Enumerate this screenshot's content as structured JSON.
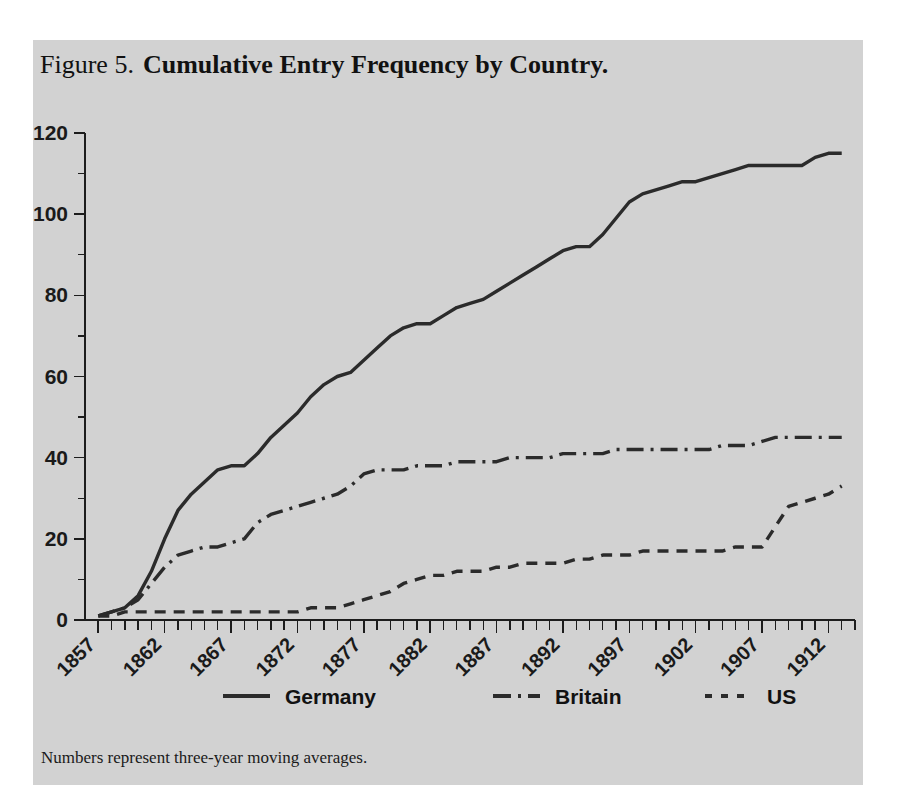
{
  "figure": {
    "number_label": "Figure 5.",
    "title": "Cumulative Entry Frequency by Country.",
    "note": "Numbers represent three-year moving averages.",
    "background_color": "#d2d2d2",
    "page_color": "#ffffff",
    "ink_color": "#2b2b2b"
  },
  "chart_data": {
    "type": "line",
    "title": "Cumulative Entry Frequency by Country.",
    "xlabel": "",
    "ylabel": "",
    "xlim": [
      1856,
      1914
    ],
    "ylim": [
      0,
      120
    ],
    "ytick_values": [
      0,
      20,
      40,
      60,
      80,
      100,
      120
    ],
    "ytick_labels": [
      "0",
      "20",
      "40",
      "60",
      "80",
      "100",
      "120"
    ],
    "y_minor_step": 10,
    "xtick_labels": [
      "1857",
      "1862",
      "1867",
      "1872",
      "1877",
      "1882",
      "1887",
      "1892",
      "1897",
      "1902",
      "1907",
      "1912"
    ],
    "xtick_values": [
      1857,
      1862,
      1867,
      1872,
      1877,
      1882,
      1887,
      1892,
      1897,
      1902,
      1907,
      1912
    ],
    "x_minor_step": 1,
    "xtick_rotation": 45,
    "grid": false,
    "legend_position": "below",
    "x": [
      1857,
      1858,
      1859,
      1860,
      1861,
      1862,
      1863,
      1864,
      1865,
      1866,
      1867,
      1868,
      1869,
      1870,
      1871,
      1872,
      1873,
      1874,
      1875,
      1876,
      1877,
      1878,
      1879,
      1880,
      1881,
      1882,
      1883,
      1884,
      1885,
      1886,
      1887,
      1888,
      1889,
      1890,
      1891,
      1892,
      1893,
      1894,
      1895,
      1896,
      1897,
      1898,
      1899,
      1900,
      1901,
      1902,
      1903,
      1904,
      1905,
      1906,
      1907,
      1908,
      1909,
      1910,
      1911,
      1912,
      1913
    ],
    "series": [
      {
        "name": "Germany",
        "line_style": "solid",
        "color": "#2b2b2b",
        "values": [
          1,
          2,
          3,
          6,
          12,
          20,
          27,
          31,
          34,
          37,
          38,
          38,
          41,
          45,
          48,
          51,
          55,
          58,
          60,
          61,
          64,
          67,
          70,
          72,
          73,
          73,
          75,
          77,
          78,
          79,
          81,
          83,
          85,
          87,
          89,
          91,
          92,
          92,
          95,
          99,
          103,
          105,
          106,
          107,
          108,
          108,
          109,
          110,
          111,
          112,
          112,
          112,
          112,
          112,
          114,
          115,
          115
        ]
      },
      {
        "name": "Britain",
        "line_style": "dashdot",
        "color": "#2b2b2b",
        "values": [
          1,
          2,
          3,
          5,
          9,
          13,
          16,
          17,
          18,
          18,
          19,
          20,
          24,
          26,
          27,
          28,
          29,
          30,
          31,
          33,
          36,
          37,
          37,
          37,
          38,
          38,
          38,
          39,
          39,
          39,
          39,
          40,
          40,
          40,
          40,
          41,
          41,
          41,
          41,
          42,
          42,
          42,
          42,
          42,
          42,
          42,
          42,
          43,
          43,
          43,
          44,
          45,
          45,
          45,
          45,
          45,
          45
        ]
      },
      {
        "name": "US",
        "line_style": "dotted",
        "color": "#2b2b2b",
        "values": [
          1,
          1,
          2,
          2,
          2,
          2,
          2,
          2,
          2,
          2,
          2,
          2,
          2,
          2,
          2,
          2,
          3,
          3,
          3,
          4,
          5,
          6,
          7,
          9,
          10,
          11,
          11,
          12,
          12,
          12,
          13,
          13,
          14,
          14,
          14,
          14,
          15,
          15,
          16,
          16,
          16,
          17,
          17,
          17,
          17,
          17,
          17,
          17,
          18,
          18,
          18,
          23,
          28,
          29,
          30,
          31,
          33
        ]
      }
    ],
    "legend": [
      {
        "label": "Germany",
        "line_style": "solid"
      },
      {
        "label": "Britain",
        "line_style": "dashdot"
      },
      {
        "label": "US",
        "line_style": "dotted"
      }
    ]
  }
}
